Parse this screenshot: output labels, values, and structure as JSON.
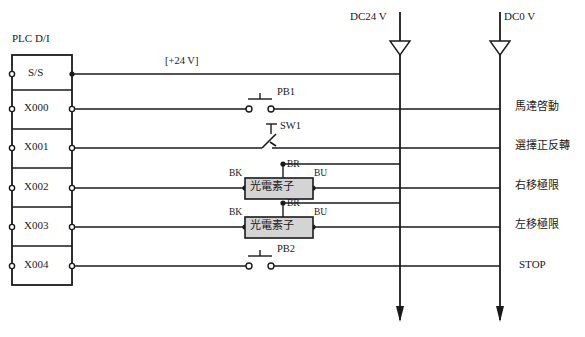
{
  "diagram": {
    "block_label": "PLC D/I",
    "rail_wire_label": "[+24 V]",
    "colors": {
      "line": "#1a1a1a",
      "sensor_fill": "#d4d4d4",
      "background": "#ffffff"
    }
  },
  "power_rails": [
    {
      "name": "dc24v",
      "label": "DC24 V",
      "x": 400
    },
    {
      "name": "dc0v",
      "label": "DC0 V",
      "x": 500
    }
  ],
  "terminals": [
    {
      "id": "ss",
      "label": "S/S",
      "y": 74,
      "function": ""
    },
    {
      "id": "x000",
      "label": "X000",
      "y": 109,
      "function": "馬達啓動"
    },
    {
      "id": "x001",
      "label": "X001",
      "y": 148,
      "function": "選擇正反轉"
    },
    {
      "id": "x002",
      "label": "X002",
      "y": 188,
      "function": "右移極限"
    },
    {
      "id": "x003",
      "label": "X003",
      "y": 227,
      "function": "左移極限"
    },
    {
      "id": "x004",
      "label": "X004",
      "y": 266,
      "function": "STOP"
    }
  ],
  "devices": [
    {
      "id": "pb1",
      "label": "PB1",
      "type": "pushbutton-no",
      "circuit": "x000"
    },
    {
      "id": "sw1",
      "label": "SW1",
      "type": "selector-switch",
      "circuit": "x001"
    },
    {
      "id": "sensor1",
      "label": "光電素子",
      "type": "photoelectric-sensor",
      "circuit": "x002",
      "wires": {
        "black": "BK",
        "brown": "BR",
        "blue": "BU"
      }
    },
    {
      "id": "sensor2",
      "label": "光電素子",
      "type": "photoelectric-sensor",
      "circuit": "x003",
      "wires": {
        "black": "BK",
        "brown": "BR",
        "blue": "BU"
      }
    },
    {
      "id": "pb2",
      "label": "PB2",
      "type": "pushbutton-no",
      "circuit": "x004"
    }
  ]
}
